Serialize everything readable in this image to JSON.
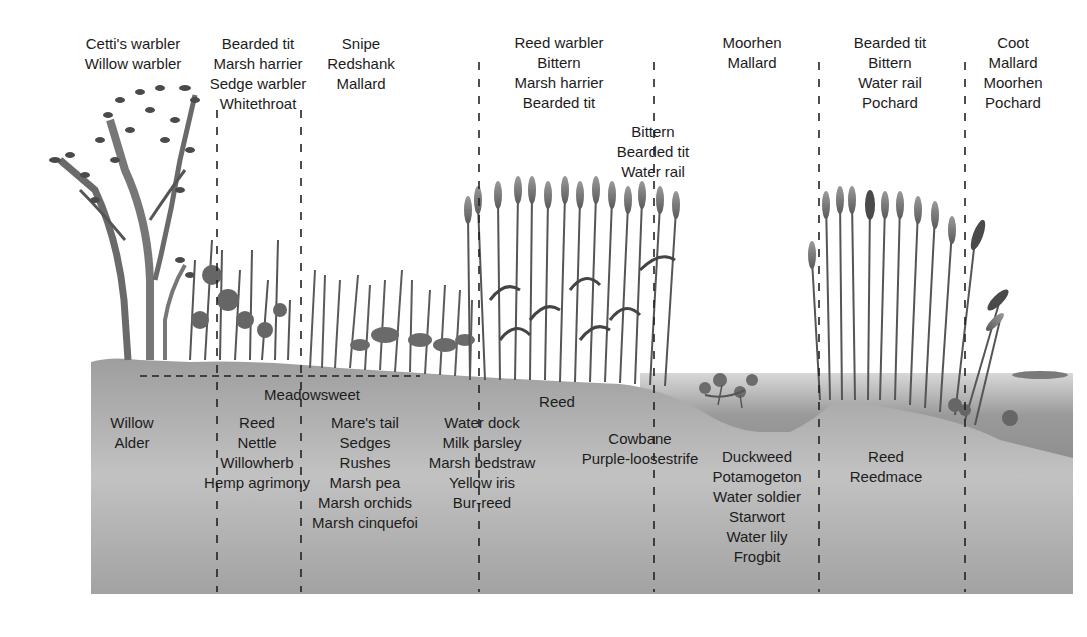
{
  "diagram": {
    "type": "wetland-succession-cross-section",
    "colors": {
      "soil": "#a9a9a9",
      "soil_light": "#c4c4c4",
      "water": "#8f8f8f",
      "vegetation_dark": "#4a4a4a",
      "vegetation_mid": "#777777",
      "divider": "#222222"
    },
    "birds": [
      {
        "id": "willow-carr",
        "x": 133,
        "y": 34,
        "species": [
          "Cetti's warbler",
          "Willow warbler"
        ]
      },
      {
        "id": "fen-tall-herb",
        "x": 258,
        "y": 34,
        "species": [
          "Bearded tit",
          "Marsh harrier",
          "Sedge warbler",
          "Whitethroat"
        ]
      },
      {
        "id": "wet-meadow",
        "x": 361,
        "y": 34,
        "species": [
          "Snipe",
          "Redshank",
          "Mallard"
        ]
      },
      {
        "id": "reedbed",
        "x": 559,
        "y": 33,
        "species": [
          "Reed warbler",
          "Bittern",
          "Marsh harrier",
          "Bearded tit"
        ]
      },
      {
        "id": "reedbed-edge",
        "x": 653,
        "y": 122,
        "species": [
          "Bittern",
          "Bearded tit",
          "Water rail"
        ]
      },
      {
        "id": "open-pool",
        "x": 752,
        "y": 33,
        "species": [
          "Moorhen",
          "Mallard"
        ]
      },
      {
        "id": "reedmace-bed",
        "x": 890,
        "y": 33,
        "species": [
          "Bearded tit",
          "Bittern",
          "Water rail",
          "Pochard"
        ]
      },
      {
        "id": "open-water",
        "x": 1013,
        "y": 33,
        "species": [
          "Coot",
          "Mallard",
          "Moorhen",
          "Pochard"
        ]
      }
    ],
    "plants": [
      {
        "id": "meadowsweet",
        "x": 312,
        "y": 385,
        "species": [
          "Meadowsweet"
        ]
      },
      {
        "id": "trees",
        "x": 132,
        "y": 413,
        "species": [
          "Willow",
          "Alder"
        ]
      },
      {
        "id": "tall-herb",
        "x": 257,
        "y": 413,
        "species": [
          "Reed",
          "Nettle",
          "Willowherb",
          "Hemp agrimony"
        ]
      },
      {
        "id": "fen-meadow",
        "x": 365,
        "y": 413,
        "species": [
          "Mare's tail",
          "Sedges",
          "Rushes",
          "Marsh pea",
          "Marsh orchids",
          "Marsh cinquefoi"
        ]
      },
      {
        "id": "reed-center",
        "x": 557,
        "y": 392,
        "species": [
          "Reed"
        ]
      },
      {
        "id": "marsh-edge",
        "x": 482,
        "y": 413,
        "species": [
          "Water dock",
          "Milk parsley",
          "Marsh bedstraw",
          "Yellow iris",
          "Bur-reed"
        ]
      },
      {
        "id": "reedbed-margin",
        "x": 640,
        "y": 429,
        "species": [
          "Cowbane",
          "Purple-loosestrife"
        ]
      },
      {
        "id": "pool-aquatics",
        "x": 757,
        "y": 447,
        "species": [
          "Duckweed",
          "Potamogeton",
          "Water soldier",
          "Starwort",
          "Water lily",
          "Frogbit"
        ]
      },
      {
        "id": "reedmace-zone",
        "x": 886,
        "y": 447,
        "species": [
          "Reed",
          "Reedmace"
        ]
      }
    ],
    "dividers": [
      {
        "x": 217,
        "top": 110,
        "bottom": 592
      },
      {
        "x": 301,
        "top": 110,
        "bottom": 592
      },
      {
        "x": 479,
        "top": 60,
        "bottom": 592
      },
      {
        "x": 654,
        "top": 60,
        "bottom": 592
      },
      {
        "x": 819,
        "top": 60,
        "bottom": 592
      },
      {
        "x": 965,
        "top": 60,
        "bottom": 592
      }
    ]
  }
}
